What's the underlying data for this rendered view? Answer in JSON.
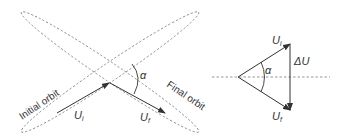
{
  "figure": {
    "left_panel": {
      "orbits": [
        {
          "name": "Initial orbit",
          "label": "Initial orbit"
        },
        {
          "name": "Final orbit",
          "label": "Final orbit"
        }
      ],
      "vectors": {
        "initial": {
          "symbol": "U",
          "subscript": "i"
        },
        "final": {
          "symbol": "U",
          "subscript": "f"
        }
      },
      "angle_label": "α"
    },
    "right_panel": {
      "vectors": {
        "initial": {
          "symbol": "U",
          "subscript": "i"
        },
        "final": {
          "symbol": "U",
          "subscript": "f"
        },
        "delta": "ΔU"
      },
      "angle_label": "α"
    },
    "colors": {
      "line": "#333333",
      "dashed": "#888888",
      "text": "#333333"
    }
  }
}
